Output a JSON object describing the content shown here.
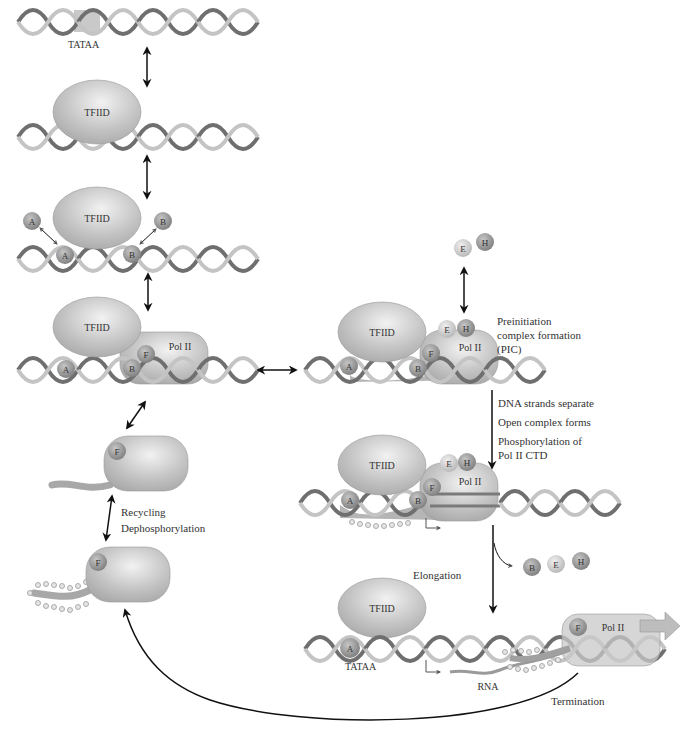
{
  "labels": {
    "tataa_top": "TATAA",
    "tataa_bottom": "TATAA",
    "tfiid": "TFIID",
    "pol2": "Pol II",
    "factor_a": "A",
    "factor_b": "B",
    "factor_e": "E",
    "factor_f": "F",
    "factor_h": "H",
    "rna": "RNA"
  },
  "annotations": {
    "pic_line1": "Preinitiation",
    "pic_line2": "complex formation",
    "pic_line3": "(PIC)",
    "dna_separate": "DNA strands separate",
    "open_complex": "Open complex forms",
    "phospho_line1": "Phosphorylation of",
    "phospho_line2": "Pol II CTD",
    "recycling": "Recycling",
    "dephospho": "Dephosphorylation",
    "elongation": "Elongation",
    "termination": "Termination"
  },
  "colors": {
    "dna_dark": "#6f6f6f",
    "dna_light": "#bdbdbd",
    "protein": "#b8b8b8",
    "factor_dark": "#8c8c8c",
    "factor_light": "#d2d2d2",
    "arrow": "#111111"
  }
}
